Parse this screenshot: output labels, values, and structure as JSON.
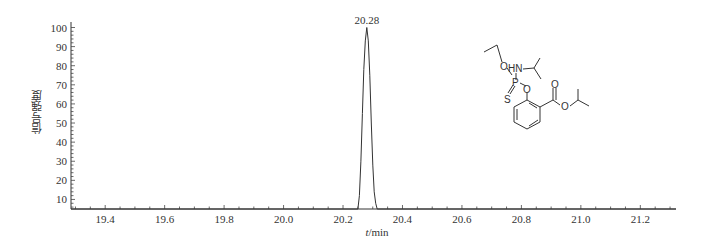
{
  "chart_data": {
    "type": "line",
    "title": "",
    "xlabel": "t/min",
    "xlabel_italic_part": "t",
    "xlabel_unit": "/min",
    "ylabel": "信号强度",
    "xlim": [
      19.285,
      21.32
    ],
    "ylim": [
      5,
      100
    ],
    "x_ticks": [
      19.4,
      19.6,
      19.8,
      20.0,
      20.2,
      20.4,
      20.6,
      20.8,
      21.0,
      21.2
    ],
    "x_tick_labels": [
      "19.4",
      "19.6",
      "19.8",
      "20.0",
      "20.2",
      "20.4",
      "20.6",
      "20.8",
      "21.0",
      "21.2"
    ],
    "y_ticks": [
      10,
      20,
      30,
      40,
      50,
      60,
      70,
      80,
      90,
      100
    ],
    "y_tick_labels": [
      "10",
      "20",
      "30",
      "40",
      "50",
      "60",
      "70",
      "80",
      "90",
      "100"
    ],
    "grid": false,
    "legend": null,
    "series": [
      {
        "name": "chromatogram",
        "x": [
          19.285,
          20.25,
          20.255,
          20.26,
          20.265,
          20.27,
          20.275,
          20.28,
          20.285,
          20.29,
          20.295,
          20.3,
          20.305,
          20.31,
          20.315,
          21.32
        ],
        "y": [
          5,
          5,
          12,
          30,
          55,
          78,
          93,
          100,
          93,
          75,
          50,
          28,
          14,
          8,
          5,
          5
        ]
      }
    ],
    "annotations": [
      {
        "text": "20.28",
        "x": 20.28,
        "y": 100,
        "type": "peak-label"
      }
    ],
    "inset": {
      "type": "chemical-structure",
      "atom_labels": [
        "O",
        "HN",
        "P",
        "O",
        "S",
        "O",
        "O"
      ]
    }
  }
}
